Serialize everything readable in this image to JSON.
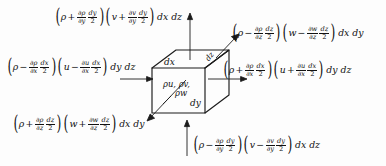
{
  "diagram": {
    "type": "control-volume-cube",
    "stroke_color": "#1b1b1b",
    "background_color": "#fdfdfd"
  },
  "cube": {
    "labels": {
      "top_edge": "dx",
      "depth_edge": "dz",
      "right_edge": "dy",
      "center_line1": "ρu, ρv,",
      "center_line2": "ρw"
    }
  },
  "flux_terms": {
    "top": {
      "position": "top",
      "face": "y-plus",
      "lead_paren": "(",
      "rho": "ρ",
      "sign1": "+",
      "d1_num": "∂ρ",
      "d1_den": "∂y",
      "d2_num": "dy",
      "d2_den": "2",
      "close_paren": ")",
      "vel": "v",
      "sign2": "+",
      "d3_num": "∂v",
      "d3_den": "∂y",
      "d4_num": "dy",
      "d4_den": "2",
      "area": "dx dz"
    },
    "bottom": {
      "position": "bottom",
      "face": "y-minus",
      "lead_paren": "(",
      "rho": "ρ",
      "sign1": "−",
      "d1_num": "∂ρ",
      "d1_den": "∂y",
      "d2_num": "dy",
      "d2_den": "2",
      "close_paren": ")",
      "vel": "v",
      "sign2": "−",
      "d3_num": "∂v",
      "d3_den": "∂y",
      "d4_num": "dy",
      "d4_den": "2",
      "area": "dx dz"
    },
    "left": {
      "position": "left",
      "face": "x-minus",
      "lead_paren": "(",
      "rho": "ρ",
      "sign1": "−",
      "d1_num": "∂ρ",
      "d1_den": "∂x",
      "d2_num": "dx",
      "d2_den": "2",
      "close_paren": ")",
      "vel": "u",
      "sign2": "−",
      "d3_num": "∂u",
      "d3_den": "∂x",
      "d4_num": "dx",
      "d4_den": "2",
      "area": "dy dz"
    },
    "right": {
      "position": "right",
      "face": "x-plus",
      "lead_paren": "(",
      "rho": "ρ",
      "sign1": "+",
      "d1_num": "∂ρ",
      "d1_den": "∂x",
      "d2_num": "dx",
      "d2_den": "2",
      "close_paren": ")",
      "vel": "u",
      "sign2": "+",
      "d3_num": "∂u",
      "d3_den": "∂x",
      "d4_num": "dx",
      "d4_den": "2",
      "area": "dy dz"
    },
    "top_right": {
      "position": "top-right",
      "face": "z-minus",
      "lead_paren": "(",
      "rho": "ρ",
      "sign1": "−",
      "d1_num": "∂ρ",
      "d1_den": "∂z",
      "d2_num": "dz",
      "d2_den": "2",
      "close_paren": ")",
      "vel": "w",
      "sign2": "−",
      "d3_num": "∂w",
      "d3_den": "∂z",
      "d4_num": "dz",
      "d4_den": "2",
      "area": "dx dy"
    },
    "bottom_left": {
      "position": "bottom-left",
      "face": "z-plus",
      "lead_paren": "(",
      "rho": "ρ",
      "sign1": "+",
      "d1_num": "∂ρ",
      "d1_den": "∂z",
      "d2_num": "dz",
      "d2_den": "2",
      "close_paren": ")",
      "vel": "w",
      "sign2": "+",
      "d3_num": "∂w",
      "d3_den": "∂z",
      "d4_num": "dz",
      "d4_den": "2",
      "area": "dx dy"
    }
  }
}
